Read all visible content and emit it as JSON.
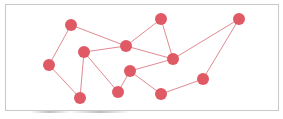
{
  "diagram": {
    "type": "network-graph",
    "colors": {
      "node": "#e05a66",
      "edge": "#e08a93",
      "border": "#c9c9c9",
      "background": "#ffffff"
    },
    "node_radius": 6,
    "nodes": [
      {
        "id": "A",
        "x": 71,
        "y": 25
      },
      {
        "id": "B",
        "x": 161,
        "y": 19
      },
      {
        "id": "C",
        "x": 239,
        "y": 19
      },
      {
        "id": "D",
        "x": 84,
        "y": 52
      },
      {
        "id": "E",
        "x": 126,
        "y": 46
      },
      {
        "id": "F",
        "x": 173,
        "y": 59
      },
      {
        "id": "G",
        "x": 49,
        "y": 65
      },
      {
        "id": "H",
        "x": 130,
        "y": 71
      },
      {
        "id": "I",
        "x": 80,
        "y": 98
      },
      {
        "id": "J",
        "x": 118,
        "y": 92
      },
      {
        "id": "K",
        "x": 161,
        "y": 94
      },
      {
        "id": "L",
        "x": 203,
        "y": 79
      }
    ],
    "edges": [
      [
        "A",
        "G"
      ],
      [
        "G",
        "I"
      ],
      [
        "A",
        "E"
      ],
      [
        "D",
        "E"
      ],
      [
        "D",
        "I"
      ],
      [
        "D",
        "J"
      ],
      [
        "E",
        "B"
      ],
      [
        "E",
        "F"
      ],
      [
        "B",
        "F"
      ],
      [
        "F",
        "C"
      ],
      [
        "F",
        "H"
      ],
      [
        "H",
        "J"
      ],
      [
        "H",
        "K"
      ],
      [
        "K",
        "L"
      ],
      [
        "L",
        "C"
      ]
    ]
  }
}
